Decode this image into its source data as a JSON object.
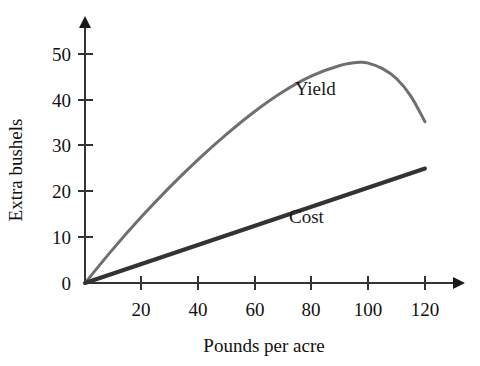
{
  "chart_data": {
    "type": "line",
    "title": "",
    "xlabel": "Pounds per acre",
    "ylabel": "Extra bushels",
    "xlim": [
      0,
      130
    ],
    "ylim": [
      0,
      55
    ],
    "grid": false,
    "legend_position": "inline-annotation",
    "xticks": [
      20,
      40,
      60,
      80,
      100,
      120
    ],
    "xtick_labels": [
      "20",
      "40",
      "60",
      "80",
      "100",
      "120"
    ],
    "yticks": [
      0,
      10,
      20,
      30,
      40,
      50
    ],
    "ytick_labels": [
      "0",
      "10",
      "20",
      "30",
      "40",
      "50"
    ],
    "series": [
      {
        "name": "Yield",
        "color": "#6f6f6f",
        "width": 3,
        "label_x": 74,
        "label_y": 41,
        "x": [
          0,
          10,
          20,
          30,
          40,
          50,
          60,
          70,
          80,
          90,
          97,
          100,
          105,
          110,
          115,
          120
        ],
        "values": [
          0,
          7.5,
          14.5,
          21,
          27,
          32.5,
          37.5,
          41.8,
          45.2,
          47.5,
          48.2,
          48.0,
          46.8,
          44.6,
          40.8,
          35.2
        ]
      },
      {
        "name": "Cost",
        "color": "#333333",
        "width": 4,
        "label_x": 72,
        "label_y": 13,
        "x": [
          0,
          120
        ],
        "values": [
          0,
          25
        ]
      }
    ]
  },
  "axes": {
    "x_axis_name": "x-axis",
    "y_axis_name": "y-axis"
  }
}
